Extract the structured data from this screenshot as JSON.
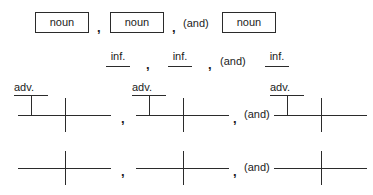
{
  "diagram": {
    "background_color": "#ffffff",
    "line_color": "#2b2b2b",
    "text_color": "#1b1b1b",
    "punctuation": {
      "comma": ",",
      "conjunction": "(and)"
    },
    "rows": [
      {
        "id": "row-nouns",
        "type": "boxed-words",
        "items": [
          {
            "label": "noun"
          },
          {
            "label": "noun"
          },
          {
            "label": "noun"
          }
        ]
      },
      {
        "id": "row-infinitives",
        "type": "underlined-words",
        "items": [
          {
            "label": "inf."
          },
          {
            "label": "inf."
          },
          {
            "label": "inf."
          }
        ]
      },
      {
        "id": "row-adverbs",
        "type": "diagram-with-modifier",
        "items": [
          {
            "modifier_label": "adv."
          },
          {
            "modifier_label": "adv."
          },
          {
            "modifier_label": "adv."
          }
        ]
      },
      {
        "id": "row-plain-baselines",
        "type": "diagram-plain",
        "items": [
          {
            "modifier_label": ""
          },
          {
            "modifier_label": ""
          },
          {
            "modifier_label": ""
          }
        ]
      }
    ]
  }
}
